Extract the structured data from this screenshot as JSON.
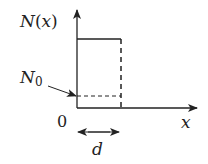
{
  "diagram": {
    "type": "step-function-plot",
    "y_axis_label": "N(x)",
    "y_axis_label_parts": {
      "func": "N",
      "open": "(",
      "var": "x",
      "close": ")"
    },
    "x_axis_label": "x",
    "origin_label": "0",
    "baseline_label": {
      "base": "N",
      "sub": "0"
    },
    "width_label": "d",
    "colors": {
      "line": "#222222",
      "background": "#ffffff"
    }
  }
}
